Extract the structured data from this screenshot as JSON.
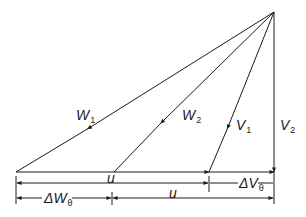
{
  "diagram": {
    "colors": {
      "line": "#1a1a1a",
      "background": "#ffffff"
    },
    "labels": {
      "w1": {
        "main": "W",
        "sub": "1"
      },
      "w2": {
        "main": "W",
        "sub": "2"
      },
      "v1": {
        "main": "V",
        "sub": "1"
      },
      "v2": {
        "main": "V",
        "sub": "2"
      },
      "u_top": {
        "main": "u"
      },
      "delta_v_theta": {
        "main": "ΔV",
        "sub": "θ"
      },
      "delta_w_theta": {
        "main": "ΔW",
        "sub": "θ"
      },
      "u_bottom": {
        "main": "u"
      }
    }
  }
}
